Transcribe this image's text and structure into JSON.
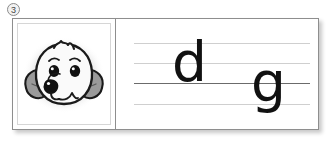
{
  "exercise": {
    "number_badge": "3"
  },
  "card": {
    "picture_panel": {
      "icon_name": "dog-face-illustration",
      "alt_text": "dog",
      "colors": {
        "ear_fill": "#9a9a9a",
        "face_fill": "#fafafa",
        "outline": "#1a1a1a",
        "nose": "#111111",
        "halo": "#d9d9d9"
      }
    },
    "writing_panel": {
      "rule_lines": [
        {
          "name": "ascender-line",
          "emphasis": "light",
          "color": "#cfcfcf"
        },
        {
          "name": "x-height-line",
          "emphasis": "light",
          "color": "#cfcfcf"
        },
        {
          "name": "baseline",
          "emphasis": "strong",
          "color": "#6b6b6b"
        },
        {
          "name": "descender-line",
          "emphasis": "light",
          "color": "#cfcfcf"
        }
      ],
      "letters": [
        {
          "char": "d",
          "position": "left"
        },
        {
          "char": "g",
          "position": "right"
        }
      ]
    }
  }
}
